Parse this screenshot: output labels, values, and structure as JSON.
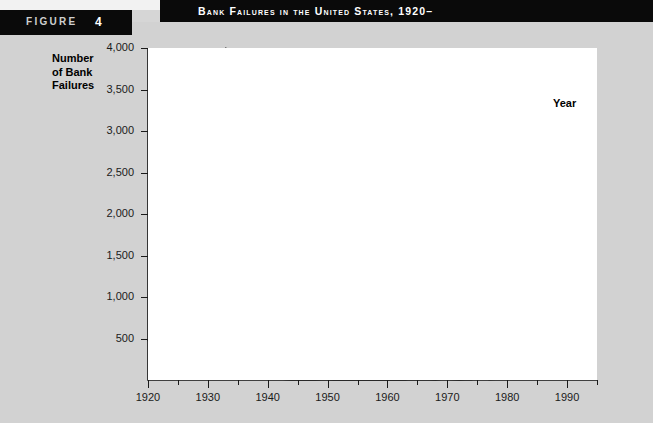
{
  "figure": {
    "label": "FIGURE",
    "number": "4"
  },
  "header": {
    "title": "Bank Failures in the United States, 1920–"
  },
  "chart_data": {
    "type": "line",
    "title": "Bank Failures in the United States, 1920–",
    "xlabel": "Year",
    "ylabel": "Number of Bank Failures",
    "ylabel_lines": [
      "Number",
      "of Bank",
      "Failures"
    ],
    "xlim": [
      1920,
      1995
    ],
    "ylim": [
      0,
      4000
    ],
    "grid": false,
    "legend": null,
    "yticks": [
      500,
      1000,
      1500,
      2000,
      2500,
      3000,
      3500,
      4000
    ],
    "ytick_labels": [
      "500",
      "1,000",
      "1,500",
      "2,000",
      "2,500",
      "3,000",
      "3,500",
      "4,000"
    ],
    "xticks_major": [
      1920,
      1930,
      1940,
      1950,
      1960,
      1970,
      1980,
      1990
    ],
    "xtick_labels": [
      "1920",
      "1930",
      "1940",
      "1950",
      "1960",
      "1970",
      "1980",
      "1990"
    ],
    "xticks_minor": [
      1925,
      1935,
      1945,
      1955,
      1965,
      1975,
      1985,
      1995
    ],
    "series": [
      {
        "name": "Bank failures",
        "x": [
          1920,
          1921,
          1922,
          1923,
          1924,
          1925,
          1926,
          1927,
          1928,
          1929,
          1930,
          1931,
          1932,
          1933,
          1934,
          1935,
          1936,
          1937,
          1938,
          1939,
          1940,
          1941,
          1942,
          1943,
          1944,
          1945,
          1946,
          1947,
          1948,
          1949,
          1950,
          1951,
          1952,
          1953,
          1954,
          1955,
          1956,
          1957,
          1958,
          1959,
          1960,
          1961,
          1962,
          1963,
          1964,
          1965,
          1966,
          1967,
          1968,
          1969,
          1970,
          1971,
          1972,
          1973,
          1974,
          1975,
          1976,
          1977,
          1978,
          1979,
          1980,
          1981,
          1982,
          1983,
          1984,
          1985,
          1986,
          1987,
          1988,
          1989,
          1990,
          1991,
          1992,
          1993,
          1994
        ],
        "values": [
          480,
          330,
          600,
          770,
          700,
          850,
          600,
          950,
          900,
          650,
          1350,
          2300,
          1450,
          4000,
          60,
          30,
          70,
          80,
          75,
          60,
          45,
          15,
          10,
          5,
          2,
          1,
          1,
          5,
          3,
          4,
          4,
          2,
          3,
          4,
          2,
          5,
          3,
          3,
          4,
          3,
          2,
          5,
          3,
          2,
          7,
          5,
          7,
          4,
          3,
          9,
          8,
          6,
          3,
          6,
          4,
          14,
          17,
          6,
          7,
          10,
          11,
          10,
          42,
          48,
          80,
          120,
          145,
          205,
          220,
          207,
          169,
          127,
          122,
          41,
          13
        ]
      }
    ],
    "annotations": [
      {
        "text": "Peak of bank failures at 1933 (~4,000)",
        "x": 1933,
        "y": 4000
      },
      {
        "text": "Savings and loan era rise in late 1980s",
        "x": 1988,
        "y": 220
      }
    ],
    "colors": {
      "line": "#1a1a1a",
      "plot_background": "#ffffff",
      "page_background": "#d2d2d2",
      "header_bar": "#0a0a0a",
      "header_text": "#ffffff"
    }
  }
}
